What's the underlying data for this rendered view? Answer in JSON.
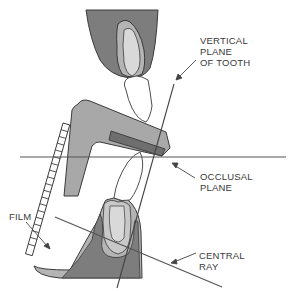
{
  "diagram": {
    "type": "dental-radiography-bisecting-technique",
    "labels": {
      "vertical_plane": [
        "VERTICAL",
        "PLANE",
        "OF TOOTH"
      ],
      "occlusal_plane": [
        "OCCLUSAL",
        "PLANE"
      ],
      "central_ray": [
        "CENTRAL",
        "RAY"
      ],
      "film": [
        "FILM"
      ]
    },
    "colors": {
      "background": "#ffffff",
      "outline": "#3a3a3a",
      "gum_dark": "#7d7d7d",
      "gum_light": "#b4b4b4",
      "tooth_light": "#d9d9d9",
      "crown_white": "#ffffff",
      "holder_gray": "#a8a8a8",
      "bite_block": "#6e6e6e",
      "film_cells": "#ffffff"
    },
    "parts": [
      "upper-tooth",
      "lower-tooth",
      "film-holder",
      "bite-block",
      "film",
      "occlusal-plane-line",
      "central-ray-line",
      "vertical-plane-line"
    ]
  }
}
